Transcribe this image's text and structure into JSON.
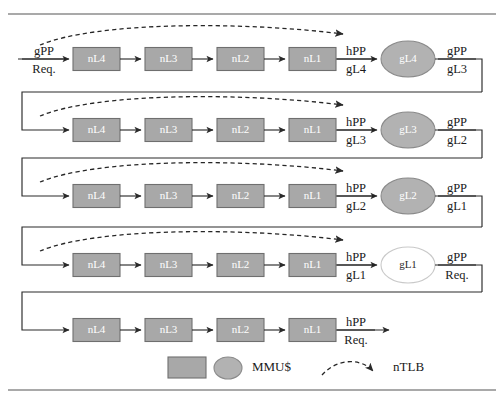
{
  "figure": {
    "rows": [
      {
        "id": "row-1",
        "blocks": [
          "nL4",
          "nL3",
          "nL2",
          "nL1"
        ],
        "circle": "gL4",
        "circle_filled": true,
        "input_label_top": "gPP",
        "input_label_bottom": "Req.",
        "mid_label_top": "hPP",
        "mid_label_bottom": "gL4",
        "output_label_top": "gPP",
        "output_label_bottom": "gL3",
        "has_ntlb_arrow": true,
        "has_input_arrow_label": true,
        "has_feedback_in": false,
        "has_feedback_out": true
      },
      {
        "id": "row-2",
        "blocks": [
          "nL4",
          "nL3",
          "nL2",
          "nL1"
        ],
        "circle": "gL3",
        "circle_filled": true,
        "input_label_top": "",
        "input_label_bottom": "",
        "mid_label_top": "hPP",
        "mid_label_bottom": "gL3",
        "output_label_top": "gPP",
        "output_label_bottom": "gL2",
        "has_ntlb_arrow": true,
        "has_input_arrow_label": false,
        "has_feedback_in": true,
        "has_feedback_out": true
      },
      {
        "id": "row-3",
        "blocks": [
          "nL4",
          "nL3",
          "nL2",
          "nL1"
        ],
        "circle": "gL2",
        "circle_filled": true,
        "input_label_top": "",
        "input_label_bottom": "",
        "mid_label_top": "hPP",
        "mid_label_bottom": "gL2",
        "output_label_top": "gPP",
        "output_label_bottom": "gL1",
        "has_ntlb_arrow": true,
        "has_input_arrow_label": false,
        "has_feedback_in": true,
        "has_feedback_out": true
      },
      {
        "id": "row-4",
        "blocks": [
          "nL4",
          "nL3",
          "nL2",
          "nL1"
        ],
        "circle": "gL1",
        "circle_filled": false,
        "input_label_top": "",
        "input_label_bottom": "",
        "mid_label_top": "hPP",
        "mid_label_bottom": "gL1",
        "output_label_top": "gPP",
        "output_label_bottom": "Req.",
        "has_ntlb_arrow": true,
        "has_input_arrow_label": false,
        "has_feedback_in": true,
        "has_feedback_out": true
      },
      {
        "id": "row-5",
        "blocks": [
          "nL4",
          "nL3",
          "nL2",
          "nL1"
        ],
        "circle": null,
        "circle_filled": false,
        "input_label_top": "",
        "input_label_bottom": "",
        "mid_label_top": "hPP",
        "mid_label_bottom": "Req.",
        "output_label_top": "",
        "output_label_bottom": "",
        "has_ntlb_arrow": false,
        "has_input_arrow_label": false,
        "has_feedback_in": true,
        "has_feedback_out": false
      }
    ],
    "legend": {
      "mmu_label": "MMU$",
      "ntlb_label": "nTLB"
    },
    "colors": {
      "mmu_fill": "#a8a8a8",
      "mmu_stroke": "#6f6f6f",
      "circle_fill": "#b2b2b2",
      "circle_stroke": "#8a8a8a",
      "line": "#2a2a2a",
      "rule": "#8c8c8c",
      "block_text": "#ffffff",
      "label_text": "#1a1a1a",
      "background": "#ffffff"
    }
  }
}
